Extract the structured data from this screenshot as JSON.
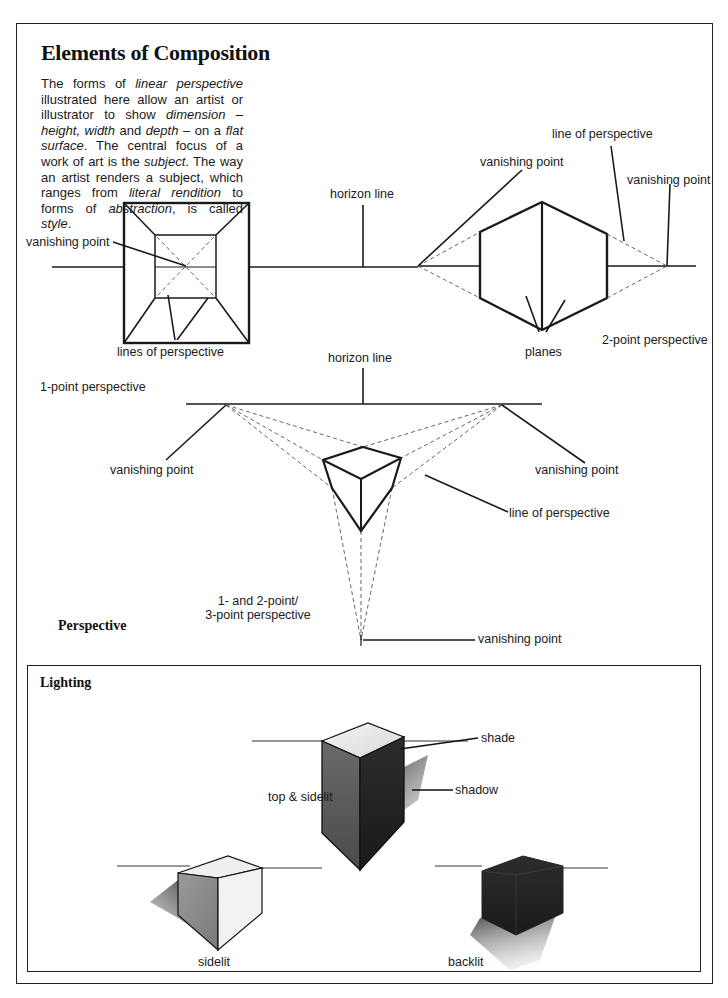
{
  "page": {
    "title": "Elements of Composition",
    "intro": [
      {
        "t": "The forms of ",
        "i": false
      },
      {
        "t": "linear perspective",
        "i": true
      },
      {
        "t": " illustrated here allow an artist or illustrator to show ",
        "i": false
      },
      {
        "t": "dimension – height, width",
        "i": true
      },
      {
        "t": " and ",
        "i": false
      },
      {
        "t": "depth",
        "i": true
      },
      {
        "t": " – on a ",
        "i": false
      },
      {
        "t": "flat surface",
        "i": true
      },
      {
        "t": ". The central focus of a work of art is the ",
        "i": false
      },
      {
        "t": "subject",
        "i": true
      },
      {
        "t": ". The way an artist renders a subject, which ranges from ",
        "i": false
      },
      {
        "t": "literal rendition",
        "i": true
      },
      {
        "t": " to forms of ",
        "i": false
      },
      {
        "t": "abstraction",
        "i": true
      },
      {
        "t": ", is called ",
        "i": false
      },
      {
        "t": "style",
        "i": true
      },
      {
        "t": ".",
        "i": false
      }
    ]
  },
  "perspective": {
    "section_title": "Perspective",
    "one_point": {
      "caption": "1-point perspective",
      "labels": {
        "vanishing_point": "vanishing point",
        "lines_of_perspective": "lines of perspective"
      }
    },
    "horizon_line_label": "horizon line",
    "two_point": {
      "caption": "2-point perspective",
      "labels": {
        "vanishing_point_left": "vanishing point",
        "vanishing_point_right": "vanishing point",
        "line_of_perspective": "line of perspective",
        "planes": "planes"
      }
    },
    "three_point": {
      "caption_line1": "1- and 2-point/",
      "caption_line2": "3-point perspective",
      "labels": {
        "horizon_line": "horizon line",
        "vanishing_point_left": "vanishing point",
        "vanishing_point_right": "vanishing point",
        "vanishing_point_bottom": "vanishing point",
        "line_of_perspective": "line of perspective"
      }
    }
  },
  "lighting": {
    "section_title": "Lighting",
    "cubes": [
      {
        "caption": "top & sidelit",
        "annotations": [
          "shade",
          "shadow"
        ]
      },
      {
        "caption": "sidelit"
      },
      {
        "caption": "backlit"
      }
    ]
  }
}
